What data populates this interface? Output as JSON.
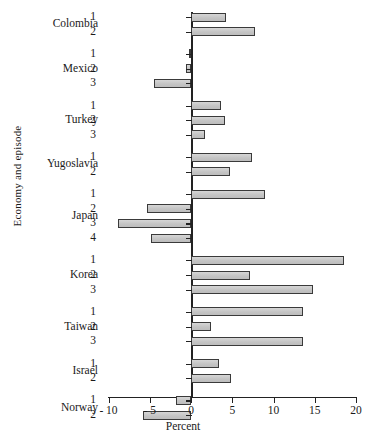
{
  "chart_data": {
    "type": "bar",
    "orientation": "horizontal",
    "title": "",
    "xlabel": "Percent",
    "ylabel": "Economy and episode",
    "xlim": [
      -10,
      20
    ],
    "xticks": [
      -10,
      -5,
      0,
      5,
      10,
      15,
      20
    ],
    "xtick_labels": [
      "- 10",
      "- 5",
      "0",
      "5",
      "10",
      "15",
      "20"
    ],
    "grid": false,
    "legend": null,
    "bar_fill": "#c9c9c9",
    "bar_edge": "#3a3a3a",
    "axis_color": "#222222",
    "groups": [
      {
        "name": "Colombia",
        "episodes": [
          "1",
          "2"
        ],
        "values": [
          4.2,
          7.8
        ]
      },
      {
        "name": "Mexico",
        "episodes": [
          "1",
          "2",
          "3"
        ],
        "values": [
          -0.2,
          -0.6,
          -4.5
        ]
      },
      {
        "name": "Turkey",
        "episodes": [
          "1",
          "2",
          "3"
        ],
        "values": [
          3.6,
          4.1,
          1.7
        ]
      },
      {
        "name": "Yugoslavia",
        "episodes": [
          "1",
          "2"
        ],
        "values": [
          7.4,
          4.7
        ]
      },
      {
        "name": "Japan",
        "episodes": [
          "1",
          "2",
          "3",
          "4"
        ],
        "values": [
          9.0,
          -5.3,
          -8.8,
          -4.8
        ]
      },
      {
        "name": "Korea",
        "episodes": [
          "1",
          "2",
          "3"
        ],
        "values": [
          18.5,
          7.2,
          14.8
        ]
      },
      {
        "name": "Taiwan",
        "episodes": [
          "1",
          "2",
          "3"
        ],
        "values": [
          13.6,
          2.4,
          13.6
        ]
      },
      {
        "name": "Israel",
        "episodes": [
          "1",
          "2"
        ],
        "values": [
          3.4,
          4.8
        ]
      },
      {
        "name": "Norway",
        "episodes": [
          "1",
          "2"
        ],
        "values": [
          -1.8,
          -5.8
        ]
      }
    ]
  }
}
